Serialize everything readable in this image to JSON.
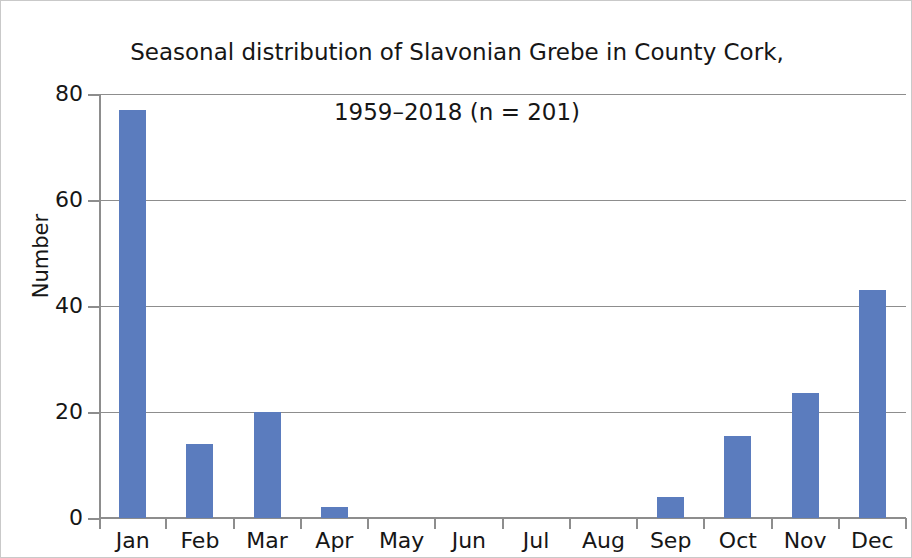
{
  "chart_data": {
    "type": "bar",
    "title": "Seasonal distribution of Slavonian Grebe in County Cork,\n1959–2018 (n = 201)",
    "title_line1": "Seasonal distribution of Slavonian Grebe in County Cork,",
    "title_line2": "1959–2018 (n = 201)",
    "xlabel": "",
    "ylabel": "Number",
    "categories": [
      "Jan",
      "Feb",
      "Mar",
      "Apr",
      "May",
      "Jun",
      "Jul",
      "Aug",
      "Sep",
      "Oct",
      "Nov",
      "Dec"
    ],
    "values": [
      77,
      14,
      20,
      2,
      0,
      0,
      0,
      0,
      4,
      15.5,
      23.5,
      43
    ],
    "ylim": [
      0,
      80
    ],
    "yticks": [
      0,
      20,
      40,
      60,
      80
    ],
    "ytick_labels": [
      "0",
      "20",
      "40",
      "60",
      "80"
    ],
    "grid": true,
    "grid_axis": "y",
    "legend": null,
    "bar_color": "#5b7cbe",
    "grid_color": "#8d8d8d",
    "text_color": "#161616",
    "total_n": 201,
    "period": "1959–2018"
  }
}
